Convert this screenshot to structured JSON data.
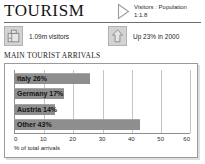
{
  "header": {
    "title": "TOURISM",
    "ratio_icon": "triangle-right-icon",
    "ratio_line1": "Visitors : Population",
    "ratio_line2": "1:1.8"
  },
  "stats": [
    {
      "icon": "suitcase-icon",
      "label": "1.09m visitors"
    },
    {
      "icon": "up-arrow-icon",
      "label": "Up 23% in 2000"
    }
  ],
  "section": {
    "title": "MAIN TOURIST ARRIVALS"
  },
  "chart_data": {
    "type": "bar",
    "orientation": "horizontal",
    "title": "MAIN TOURIST ARRIVALS",
    "categories": [
      "Italy",
      "Germany",
      "Austria",
      "Other"
    ],
    "values": [
      26,
      17,
      14,
      43
    ],
    "bar_labels": [
      "Italy 26%",
      "Germany 17%",
      "Austria 14%",
      "Other 43%"
    ],
    "xlabel": "% of total arrivals",
    "ylabel": "",
    "xlim": [
      0,
      60
    ],
    "xticks": [
      0,
      10,
      20,
      30,
      40,
      50,
      60
    ],
    "xtick_labels": [
      "0",
      "10",
      "20",
      "30",
      "40",
      "50",
      "60"
    ],
    "grid": true,
    "legend": false,
    "bar_color": "#8e8e8e",
    "grid_color": "#c4c4c4",
    "axis_color": "#8d8d8d"
  }
}
